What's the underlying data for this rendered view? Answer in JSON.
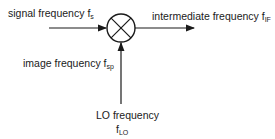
{
  "diagram": {
    "type": "mixer-block",
    "labels": {
      "signal": {
        "text": "signal frequency f",
        "sub": "s"
      },
      "intermediate": {
        "text": "intermediate frequency f",
        "sub": "IF"
      },
      "image": {
        "text": "image frequency f",
        "sub": "sp"
      },
      "lo": {
        "text": "LO frequency",
        "symbol": "f",
        "sub": "LO"
      }
    },
    "colors": {
      "line": "#1a1a1a",
      "background": "#ffffff"
    }
  }
}
